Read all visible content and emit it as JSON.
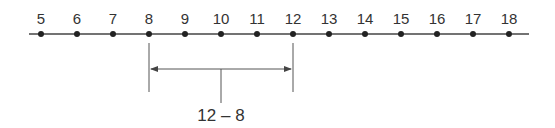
{
  "number_line": {
    "min": 5,
    "max": 18,
    "points": [
      5,
      6,
      7,
      8,
      9,
      10,
      11,
      12,
      13,
      14,
      15,
      16,
      17,
      18
    ],
    "labels": [
      "5",
      "6",
      "7",
      "8",
      "9",
      "10",
      "11",
      "12",
      "13",
      "14",
      "15",
      "16",
      "17",
      "18"
    ]
  },
  "interval": {
    "start": 8,
    "end": 12,
    "label": "12 – 8",
    "arrow": "double-headed"
  },
  "colors": {
    "ink": "#333333",
    "background": "#ffffff"
  }
}
